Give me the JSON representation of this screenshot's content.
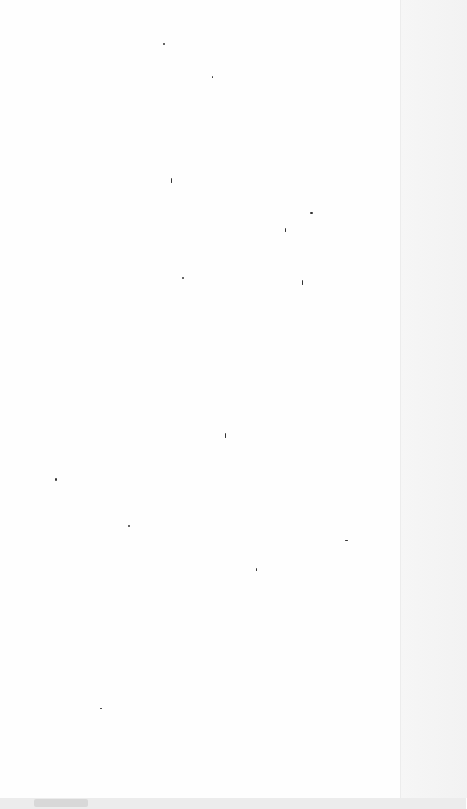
{
  "page": {
    "specks": [
      [
        163,
        43,
        2,
        2
      ],
      [
        212,
        76,
        1,
        2
      ],
      [
        171,
        178,
        1,
        5
      ],
      [
        310,
        212,
        3,
        2
      ],
      [
        285,
        228,
        1,
        4
      ],
      [
        182,
        277,
        2,
        2
      ],
      [
        302,
        280,
        1,
        5
      ],
      [
        225,
        433,
        1,
        5
      ],
      [
        55,
        478,
        2,
        3
      ],
      [
        128,
        525,
        2,
        2
      ],
      [
        345,
        540,
        3,
        1
      ],
      [
        256,
        568,
        1,
        3
      ],
      [
        100,
        708,
        2,
        1
      ]
    ]
  }
}
